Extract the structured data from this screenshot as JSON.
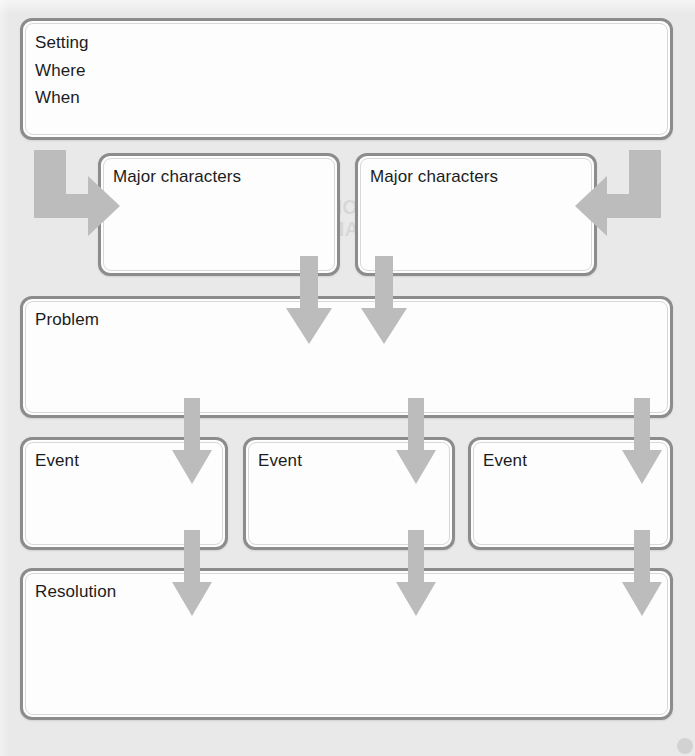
{
  "colors": {
    "page_background": "#e9e9e9",
    "box_fill": "#fdfdfd",
    "box_border": "#8c8c8c",
    "arrow": "#bcbcbc",
    "text": "#1c1c1c"
  },
  "boxes": {
    "setting": {
      "lines": [
        "Setting",
        "Where",
        "When"
      ]
    },
    "characters": [
      {
        "label": "Major characters"
      },
      {
        "label": "Major characters"
      }
    ],
    "problem": {
      "label": "Problem"
    },
    "events": [
      {
        "label": "Event"
      },
      {
        "label": "Event"
      },
      {
        "label": "Event"
      }
    ],
    "resolution": {
      "label": "Resolution"
    }
  },
  "arrows": {
    "elbow_left": "elbow-arrow-right-icon",
    "elbow_right": "elbow-arrow-left-icon",
    "characters_to_problem": [
      "down-arrow-icon",
      "down-arrow-icon"
    ],
    "problem_to_events": [
      "down-arrow-icon",
      "down-arrow-icon",
      "down-arrow-icon"
    ],
    "events_to_resolution": [
      "down-arrow-icon",
      "down-arrow-icon",
      "down-arrow-icon"
    ]
  },
  "ghost_text": {
    "header": "Tips for Goal-Setting Implementation",
    "chart": "CHART OF",
    "chart2": "SVSAB",
    "small_a": "Student",
    "small_b": "Goals"
  }
}
